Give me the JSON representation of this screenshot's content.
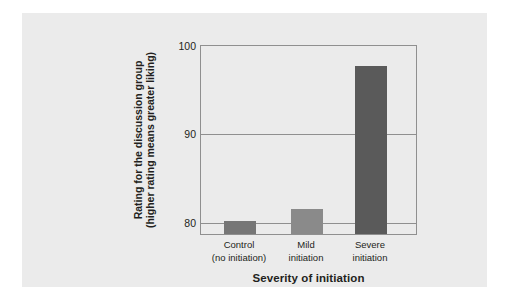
{
  "chart_data": {
    "type": "bar",
    "title": "",
    "categories": [
      "Control (no initiation)",
      "Mild initiation",
      "Severe initiation"
    ],
    "category_lines": [
      [
        "Control",
        "(no initiation)"
      ],
      [
        "Mild",
        "initiation"
      ],
      [
        "Severe",
        "initiation"
      ]
    ],
    "values": [
      80.0,
      81.3,
      97.5
    ],
    "bar_colors": [
      "#767676",
      "#8a8a8a",
      "#5a5a5a"
    ],
    "xlabel": "Severity of initiation",
    "ylabel_lines": [
      "Rating for the discussion group",
      "(higher rating means greater liking)"
    ],
    "ylim": [
      80,
      100
    ],
    "y_display_min": 78.5,
    "yticks": [
      "100",
      "90",
      "80"
    ],
    "ytick_values": [
      100,
      90,
      80
    ],
    "grid": true,
    "grid_axis": "y",
    "legend": "none"
  },
  "figure": {
    "panel_color": "#ebebeb",
    "axis_color": "#8f8f8f",
    "text_color": "#231f20",
    "background": "#ffffff"
  }
}
